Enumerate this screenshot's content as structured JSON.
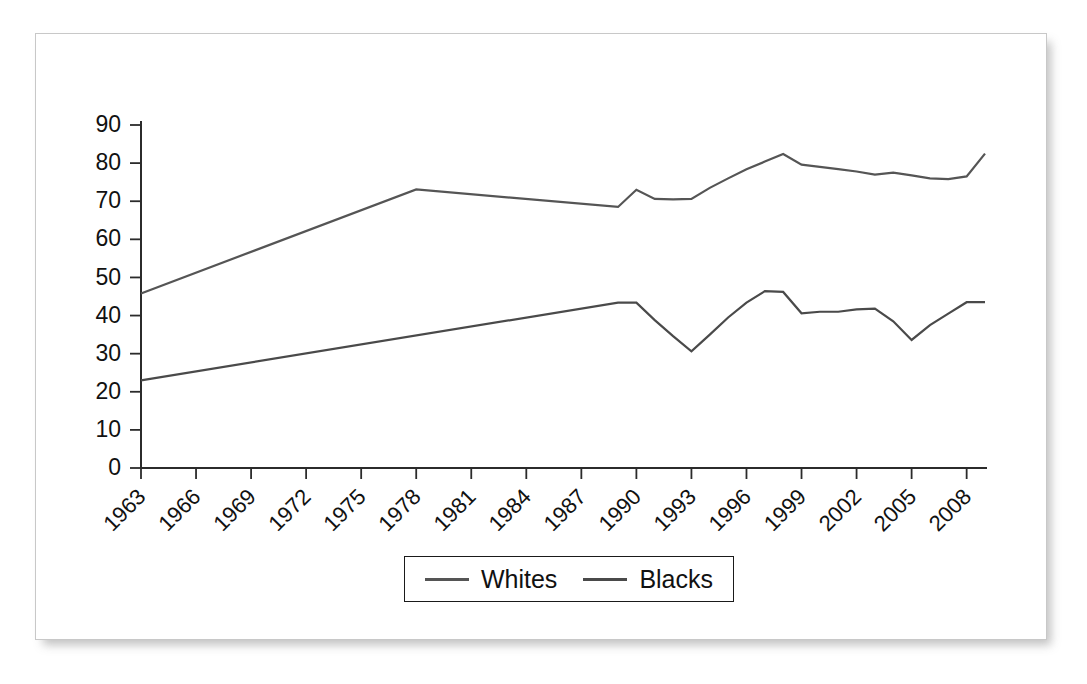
{
  "figure": {
    "background_color": "#ffffff",
    "frame_border_color": "#c8c8c8"
  },
  "chart_data": {
    "type": "line",
    "title": "",
    "subtitle": "",
    "xlabel": "",
    "ylabel": "",
    "xlim": [
      1963,
      2009
    ],
    "ylim": [
      0,
      90
    ],
    "grid": false,
    "legend_position": "bottom",
    "y_ticks": [
      0,
      10,
      20,
      30,
      40,
      50,
      60,
      70,
      80,
      90
    ],
    "x_tick_labels": [
      "1963",
      "1966",
      "1969",
      "1972",
      "1975",
      "1978",
      "1981",
      "1984",
      "1987",
      "1990",
      "1993",
      "1996",
      "1999",
      "2002",
      "2005",
      "2008"
    ],
    "x_tick_values": [
      1963,
      1966,
      1969,
      1972,
      1975,
      1978,
      1981,
      1984,
      1987,
      1990,
      1993,
      1996,
      1999,
      2002,
      2005,
      2008
    ],
    "series": [
      {
        "name": "Whites",
        "color": "#555555",
        "x": [
          1963,
          1978,
          1989,
          1990,
          1991,
          1992,
          1993,
          1994,
          1995,
          1996,
          1997,
          1998,
          1999,
          2000,
          2001,
          2002,
          2003,
          2004,
          2005,
          2006,
          2007,
          2008,
          2009
        ],
        "values": [
          45.8,
          73.1,
          68.5,
          73.0,
          70.6,
          70.5,
          70.6,
          73.5,
          76.0,
          78.4,
          80.4,
          82.4,
          79.6,
          79.0,
          78.4,
          77.8,
          77.0,
          77.5,
          76.8,
          76.0,
          75.8,
          76.5,
          82.5
        ]
      },
      {
        "name": "Blacks",
        "color": "#4a4a4a",
        "x": [
          1963,
          1989,
          1990,
          1991,
          1992,
          1993,
          1994,
          1995,
          1996,
          1997,
          1998,
          1999,
          2000,
          2001,
          2002,
          2003,
          2004,
          2005,
          2006,
          2007,
          2008,
          2009
        ],
        "values": [
          23.0,
          43.4,
          43.4,
          38.8,
          34.6,
          30.6,
          35.0,
          39.5,
          43.4,
          46.4,
          46.2,
          40.6,
          41.0,
          41.0,
          41.6,
          41.8,
          38.5,
          33.6,
          37.5,
          40.5,
          43.5,
          43.5
        ]
      }
    ]
  },
  "legend": {
    "entries": [
      {
        "label": "Whites",
        "color": "#555555"
      },
      {
        "label": "Blacks",
        "color": "#4a4a4a"
      }
    ]
  }
}
